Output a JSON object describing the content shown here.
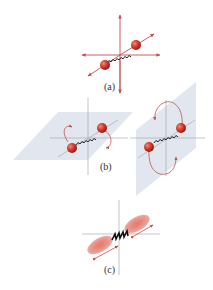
{
  "figure": {
    "panels": [
      {
        "id": "a",
        "label": "(a)",
        "description": "translation: molecule with axes arrows in three directions"
      },
      {
        "id": "b",
        "label": "(b)",
        "description": "rotation about two perpendicular axes"
      },
      {
        "id": "c",
        "label": "(c)",
        "description": "vibration along bond axis"
      }
    ],
    "colors": {
      "arrow": "#c0504d",
      "atom": "#d23a2a",
      "spring": "#222222",
      "plane": "#dde3ec",
      "axis": "#9aa0a8"
    }
  }
}
